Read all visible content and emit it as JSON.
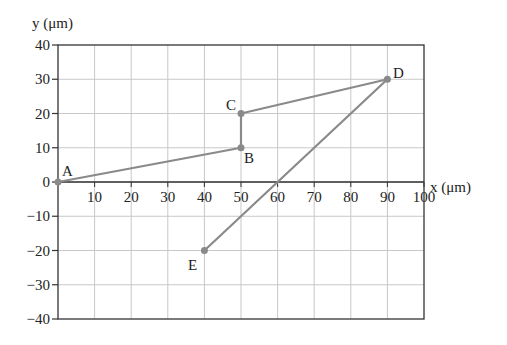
{
  "chart_data": {
    "type": "line",
    "title": "",
    "xlabel": "x (μm)",
    "ylabel": "y (μm)",
    "xlim": [
      0,
      100
    ],
    "ylim": [
      -40,
      40
    ],
    "grid": true,
    "x_ticks": [
      10,
      20,
      30,
      40,
      50,
      60,
      70,
      80,
      90,
      100
    ],
    "y_ticks": [
      40,
      30,
      20,
      10,
      0,
      -10,
      -20,
      -30,
      -40
    ],
    "series": [
      {
        "name": "path",
        "points": [
          {
            "label": "A",
            "x": 0,
            "y": 0
          },
          {
            "label": "B",
            "x": 50,
            "y": 10
          },
          {
            "label": "C",
            "x": 50,
            "y": 20
          },
          {
            "label": "D",
            "x": 90,
            "y": 30
          },
          {
            "label": "E",
            "x": 40,
            "y": -20
          }
        ]
      }
    ],
    "colors": {
      "line": "#8a8a8a",
      "grid": "#c8c8c8",
      "axis": "#333333"
    }
  },
  "labels": {
    "x_axis": "x (μm)",
    "y_axis": "y (μm)",
    "A": "A",
    "B": "B",
    "C": "C",
    "D": "D",
    "E": "E"
  }
}
